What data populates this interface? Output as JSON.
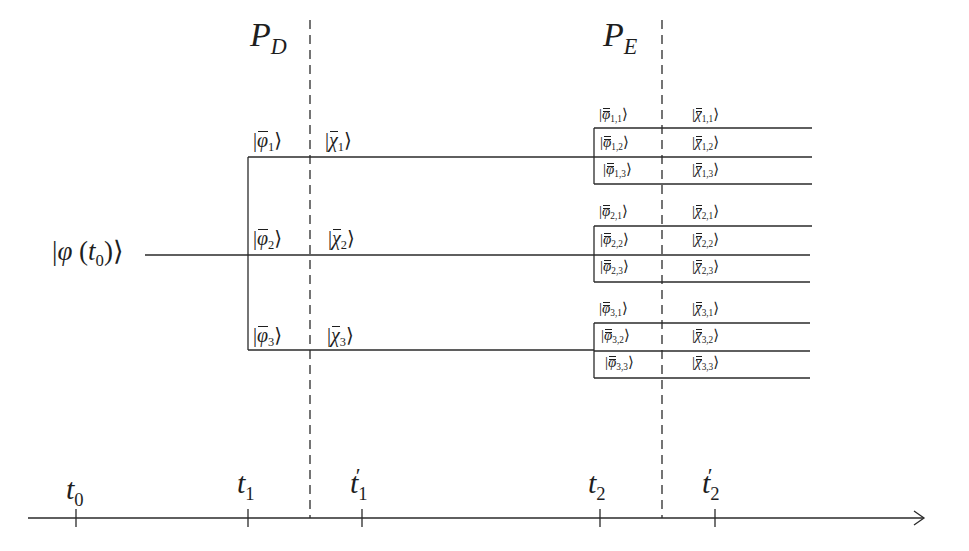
{
  "diagram": {
    "type": "quantum-state-branching-timeline",
    "initial_state": {
      "symbol": "φ",
      "argument": "t",
      "argument_sub": "0",
      "label": "|φ (t0)⟩"
    },
    "projectors": [
      {
        "id": "P_D",
        "base": "P",
        "sub": "D",
        "label": "P_D",
        "x": 310
      },
      {
        "id": "P_E",
        "base": "P",
        "sub": "E",
        "label": "P_E",
        "x": 662
      }
    ],
    "first_branches": [
      {
        "phi": {
          "base": "φ",
          "sub": "1",
          "label": "|φ̄1⟩"
        },
        "chi": {
          "base": "χ",
          "sub": "1",
          "label": "|χ̄1⟩"
        },
        "y": 157
      },
      {
        "phi": {
          "base": "φ",
          "sub": "2",
          "label": "|φ̄2⟩"
        },
        "chi": {
          "base": "χ",
          "sub": "2",
          "label": "|χ̄2⟩"
        },
        "y": 255
      },
      {
        "phi": {
          "base": "φ",
          "sub": "3",
          "label": "|φ̄3⟩"
        },
        "chi": {
          "base": "χ",
          "sub": "3",
          "label": "|χ̄3⟩"
        },
        "y": 350
      }
    ],
    "second_branches": [
      {
        "group": 1,
        "items": [
          {
            "phi": {
              "base": "φ",
              "sub": "1,1"
            },
            "chi": {
              "base": "χ",
              "sub": "1,1"
            },
            "y": 128
          },
          {
            "phi": {
              "base": "φ",
              "sub": "1,2"
            },
            "chi": {
              "base": "χ",
              "sub": "1,2"
            },
            "y": 157
          },
          {
            "phi": {
              "base": "φ",
              "sub": "1,3"
            },
            "chi": {
              "base": "χ",
              "sub": "1,3"
            },
            "y": 184
          }
        ]
      },
      {
        "group": 2,
        "items": [
          {
            "phi": {
              "base": "φ",
              "sub": "2,1"
            },
            "chi": {
              "base": "χ",
              "sub": "2,1"
            },
            "y": 226
          },
          {
            "phi": {
              "base": "φ",
              "sub": "2,2"
            },
            "chi": {
              "base": "χ",
              "sub": "2,2"
            },
            "y": 255
          },
          {
            "phi": {
              "base": "φ",
              "sub": "2,3"
            },
            "chi": {
              "base": "χ",
              "sub": "2,3"
            },
            "y": 282
          }
        ]
      },
      {
        "group": 3,
        "items": [
          {
            "phi": {
              "base": "φ",
              "sub": "3,1"
            },
            "chi": {
              "base": "χ",
              "sub": "3,1"
            },
            "y": 323
          },
          {
            "phi": {
              "base": "φ",
              "sub": "3,2"
            },
            "chi": {
              "base": "χ",
              "sub": "3,2"
            },
            "y": 351
          },
          {
            "phi": {
              "base": "φ",
              "sub": "3,3"
            },
            "chi": {
              "base": "χ",
              "sub": "3,3"
            },
            "y": 378
          }
        ]
      }
    ],
    "time_axis": {
      "ticks": [
        {
          "base": "t",
          "sub": "0",
          "prime": "",
          "label": "t0",
          "x": 76
        },
        {
          "base": "t",
          "sub": "1",
          "prime": "",
          "label": "t1",
          "x": 248
        },
        {
          "base": "t",
          "sub": "1",
          "prime": "′",
          "label": "t1′",
          "x": 362
        },
        {
          "base": "t",
          "sub": "2",
          "prime": "",
          "label": "t2",
          "x": 600
        },
        {
          "base": "t",
          "sub": "2",
          "prime": "′",
          "label": "t2′",
          "x": 715
        }
      ]
    },
    "symbols": {
      "ket_open": "|",
      "ket_close": "⟩",
      "paren_open": "(",
      "paren_close": ")"
    },
    "colors": {
      "line": "#2a2a2a",
      "text": "#1e1e1e",
      "background": "#ffffff"
    }
  }
}
